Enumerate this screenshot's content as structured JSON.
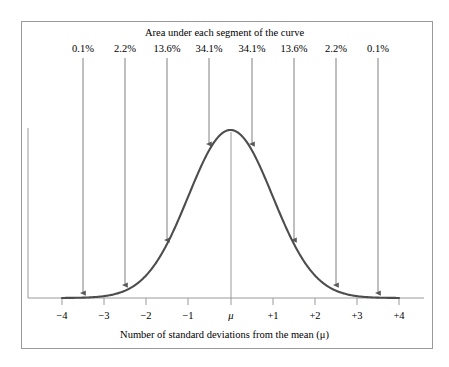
{
  "chart_data": {
    "type": "area",
    "title": "Area under each segment of the curve",
    "xlabel": "Number of standard deviations from the mean (μ)",
    "ylabel": "",
    "xlim": [
      -4,
      4
    ],
    "ylim": [
      0,
      0.42
    ],
    "grid": false,
    "legend": "none",
    "curve": "standard normal probability density",
    "x_ticks": [
      {
        "value": -4,
        "label": "−4",
        "px": 62
      },
      {
        "value": -3,
        "label": "−3",
        "px": 104
      },
      {
        "value": -2,
        "label": "−2",
        "px": 146
      },
      {
        "value": -1,
        "label": "−1",
        "px": 188
      },
      {
        "value": 0,
        "label": "μ",
        "px": 231,
        "italic": true
      },
      {
        "value": 1,
        "label": "+1",
        "px": 273
      },
      {
        "value": 2,
        "label": "+2",
        "px": 315
      },
      {
        "value": 3,
        "label": "+3",
        "px": 357
      },
      {
        "value": 4,
        "label": "+4",
        "px": 399
      }
    ],
    "segments": [
      {
        "label": "0.1%",
        "value": 0.1,
        "range": [
          -4,
          -3
        ],
        "center": -3.5,
        "px": 83,
        "arrow_y_end": 293
      },
      {
        "label": "2.2%",
        "value": 2.2,
        "range": [
          -3,
          -2
        ],
        "center": -2.5,
        "px": 125,
        "arrow_y_end": 285
      },
      {
        "label": "13.6%",
        "value": 13.6,
        "range": [
          -2,
          -1
        ],
        "center": -1.5,
        "px": 167,
        "arrow_y_end": 240
      },
      {
        "label": "34.1%",
        "value": 34.1,
        "range": [
          -1,
          0
        ],
        "center": -0.5,
        "px": 209,
        "arrow_y_end": 144
      },
      {
        "label": "34.1%",
        "value": 34.1,
        "range": [
          0,
          1
        ],
        "center": 0.5,
        "px": 252,
        "arrow_y_end": 144
      },
      {
        "label": "13.6%",
        "value": 13.6,
        "range": [
          1,
          2
        ],
        "center": 1.5,
        "px": 294,
        "arrow_y_end": 240
      },
      {
        "label": "2.2%",
        "value": 2.2,
        "range": [
          2,
          3
        ],
        "center": 2.5,
        "px": 336,
        "arrow_y_end": 285
      },
      {
        "label": "0.1%",
        "value": 0.1,
        "range": [
          3,
          4
        ],
        "center": 3.5,
        "px": 378,
        "arrow_y_end": 293
      }
    ],
    "colors": {
      "curve": "#4d4d4d",
      "axis": "#9a9a9a",
      "arrow": "#808080",
      "frame": "#9a9a9a",
      "text": "#000000",
      "background": "#ffffff"
    }
  }
}
